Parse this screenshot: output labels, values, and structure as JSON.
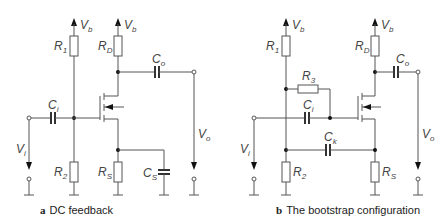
{
  "figure": {
    "panels": [
      {
        "id": "a",
        "letter": "a",
        "caption": "DC feedback",
        "labels": {
          "vb1": {
            "main": "V",
            "sub": "b"
          },
          "vb2": {
            "main": "V",
            "sub": "b"
          },
          "r1": {
            "main": "R",
            "sub": "1"
          },
          "rd": {
            "main": "R",
            "sub": "D"
          },
          "co": {
            "main": "C",
            "sub": "o"
          },
          "ci": {
            "main": "C",
            "sub": "i"
          },
          "vi": {
            "main": "V",
            "sub": "i"
          },
          "vo": {
            "main": "V",
            "sub": "o"
          },
          "r2": {
            "main": "R",
            "sub": "2"
          },
          "rs": {
            "main": "R",
            "sub": "S"
          },
          "cs": {
            "main": "C",
            "sub": "S"
          }
        }
      },
      {
        "id": "b",
        "letter": "b",
        "caption": "The bootstrap configuration",
        "labels": {
          "vb1": {
            "main": "V",
            "sub": "b"
          },
          "vb2": {
            "main": "V",
            "sub": "b"
          },
          "r1": {
            "main": "R",
            "sub": "1"
          },
          "rd": {
            "main": "R",
            "sub": "D"
          },
          "r3": {
            "main": "R",
            "sub": "3"
          },
          "co": {
            "main": "C",
            "sub": "o"
          },
          "ci": {
            "main": "C",
            "sub": "i"
          },
          "ck": {
            "main": "C",
            "sub": "k"
          },
          "vi": {
            "main": "V",
            "sub": "i"
          },
          "vo": {
            "main": "V",
            "sub": "o"
          },
          "r2": {
            "main": "R",
            "sub": "2"
          },
          "rs": {
            "main": "R",
            "sub": "S"
          }
        }
      }
    ]
  }
}
